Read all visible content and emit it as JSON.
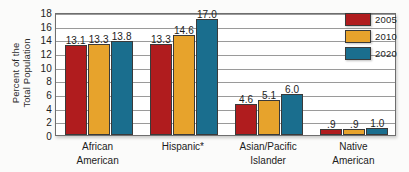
{
  "chart_data": {
    "type": "bar",
    "title": "",
    "subtitle": "",
    "xlabel": "",
    "ylabel": "Percent of the Total Population",
    "ylabel_lines": [
      "Percent of the",
      "Total Population"
    ],
    "categories": [
      "African American",
      "Hispanic*",
      "Asian/Pacific Islander",
      "Native American"
    ],
    "category_lines": [
      [
        "African",
        "American"
      ],
      [
        "Hispanic*"
      ],
      [
        "Asian/Pacific",
        "Islander"
      ],
      [
        "Native",
        "American"
      ]
    ],
    "series": [
      {
        "name": "2005",
        "color": "#b01c1e",
        "values": [
          13.1,
          13.3,
          4.6,
          0.9
        ],
        "labels": [
          "13.1",
          "13.3",
          "4.6",
          ".9"
        ]
      },
      {
        "name": "2010",
        "color": "#e7a32c",
        "values": [
          13.3,
          14.6,
          5.1,
          0.9
        ],
        "labels": [
          "13.3",
          "14.6",
          "5.1",
          ".9"
        ]
      },
      {
        "name": "2020",
        "color": "#1a6e8e",
        "values": [
          13.8,
          17.0,
          6.0,
          1.0
        ],
        "labels": [
          "13.8",
          "17.0",
          "6.0",
          "1.0"
        ]
      }
    ],
    "ylim": [
      0,
      18
    ],
    "yticks": [
      0,
      2,
      4,
      6,
      8,
      10,
      12,
      14,
      16,
      18
    ],
    "ytick_labels": [
      "0",
      "2",
      "4",
      "6",
      "8",
      "10",
      "12",
      "14",
      "16",
      "18"
    ],
    "grid": true,
    "legend_position": "top-right",
    "legend_entries": [
      "2005",
      "2010",
      "2020"
    ]
  }
}
